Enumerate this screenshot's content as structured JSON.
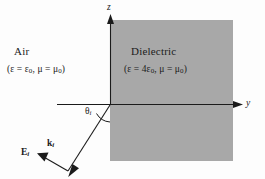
{
  "figure": {
    "background_color": "#fdfdfd",
    "line_color": "#1b1b1b"
  },
  "regions": [
    {
      "id": "air",
      "name": "Air",
      "formula": "(ε = ε",
      "formula_full": "(ε = ε0, μ = μ0)",
      "permittivity_symbol": "ε",
      "permittivity_value": "ε",
      "permittivity_sub": "0",
      "permeability_symbol": "μ",
      "permeability_value": "μ",
      "permeability_sub": "0",
      "eq1": "ε = ε",
      "eq2": ", μ = μ",
      "fill": "none"
    },
    {
      "id": "dielectric",
      "name": "Dielectric",
      "formula_full": "(ε = 4ε0, μ = μ0)",
      "eq1": "ε = 4ε",
      "eq2": ", μ = μ",
      "permittivity_sub": "0",
      "permeability_sub": "0",
      "fill": "#a8a8a8"
    }
  ],
  "axes": {
    "vertical": {
      "label": "z",
      "name": "z-axis"
    },
    "horizontal": {
      "label": "y",
      "name": "y-axis"
    }
  },
  "angle": {
    "label": "θ",
    "subscript": "i",
    "name": "angle-of-incidence"
  },
  "vectors": [
    {
      "id": "k-incident",
      "label": "k",
      "subscript": "i",
      "description": "incident wave vector"
    },
    {
      "id": "e-incident",
      "label": "E",
      "subscript": "i",
      "description": "incident electric field"
    }
  ],
  "geometry": {
    "origin": [
      110,
      105
    ],
    "dielectric_rect": [
      110,
      20,
      123,
      141
    ],
    "y_axis": [
      57,
      105,
      241,
      105
    ],
    "z_axis": [
      110,
      105,
      110,
      16
    ],
    "ray_start": [
      68,
      171
    ],
    "ray_end": [
      110,
      105
    ],
    "e_vector_end": [
      38,
      158
    ]
  },
  "colors": {
    "dielectric_fill": "#a8a8a8",
    "stroke": "#1b1b1b",
    "page": "#fdfdfd"
  }
}
